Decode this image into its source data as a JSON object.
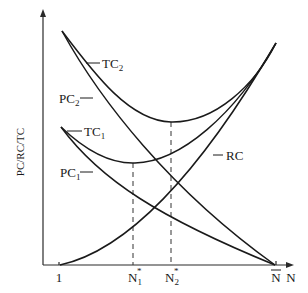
{
  "diagram": {
    "y_axis_label": "PC/RC/TC",
    "x_axis_label": "N",
    "x_ticks": {
      "one": "1",
      "n1_star": {
        "base": "N",
        "sub": "1",
        "sup": "*"
      },
      "n2_star": {
        "base": "N",
        "sub": "2",
        "sup": "*"
      },
      "n_bar": "N"
    },
    "curves": {
      "tc2": {
        "base": "TC",
        "sub": "2"
      },
      "pc2": {
        "base": "PC",
        "sub": "2"
      },
      "tc1": {
        "base": "TC",
        "sub": "1"
      },
      "pc1": {
        "base": "PC",
        "sub": "1"
      },
      "rc": {
        "base": "RC"
      }
    }
  }
}
